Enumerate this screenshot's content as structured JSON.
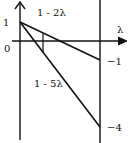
{
  "diagram": {
    "axis_labels": {
      "x": "λ",
      "origin": "0",
      "y_tick_one": "1"
    },
    "lines": [
      {
        "name": "line-1-minus-2lambda",
        "label": "1 - 2λ",
        "end_value_label": "−1"
      },
      {
        "name": "line-1-minus-5lambda",
        "label": "1 - 5λ",
        "end_value_label": "−4"
      }
    ],
    "colors": {
      "stroke": "#111111",
      "background": "#ffffff"
    }
  }
}
